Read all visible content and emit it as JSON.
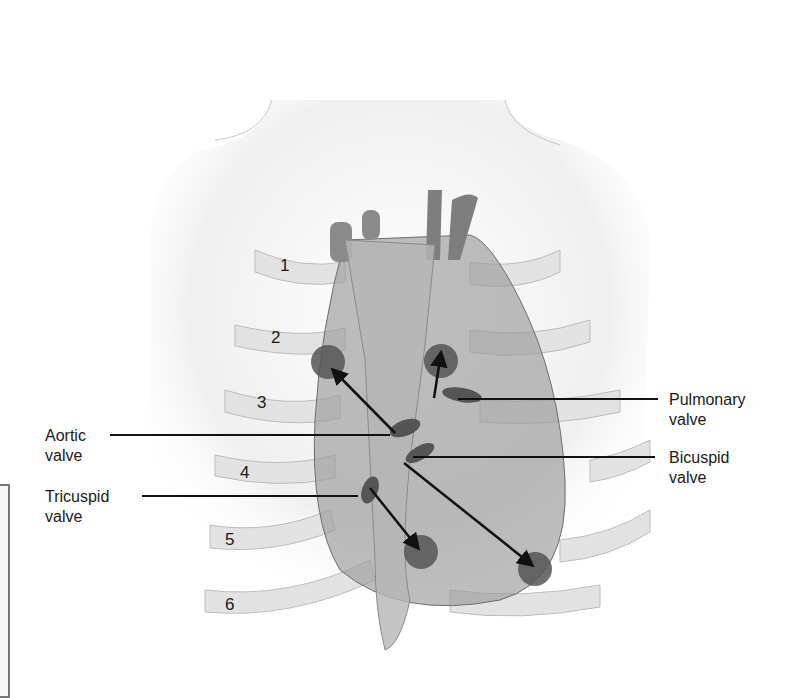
{
  "figure": {
    "labels": [
      {
        "id": "aortic",
        "text": "Aortic\nvalve",
        "side": "left"
      },
      {
        "id": "tricuspid",
        "text": "Tricuspid\nvalve",
        "side": "left"
      },
      {
        "id": "pulmonary",
        "text": "Pulmonary\nvalve",
        "side": "right"
      },
      {
        "id": "bicuspid",
        "text": "Bicuspid\nvalve",
        "side": "right"
      }
    ],
    "rib_numbers": [
      "1",
      "2",
      "3",
      "4",
      "5",
      "6"
    ],
    "colors": {
      "heart": "#8a8a8a",
      "heart_dark": "#5e5e5e",
      "auscultation_circle": "#555555",
      "rib": "#d8d8d8",
      "leader_line": "#111111",
      "skin_shade": "#e6e6e6"
    }
  }
}
